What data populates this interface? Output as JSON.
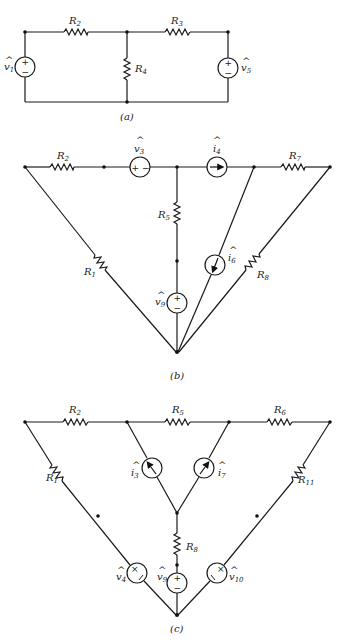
{
  "figure": {
    "panels": [
      {
        "id": "a",
        "caption": "(a)",
        "components": [
          {
            "type": "voltage-source",
            "label": "v1",
            "hat": true,
            "polarity": "+ top"
          },
          {
            "type": "resistor",
            "label": "R2"
          },
          {
            "type": "resistor",
            "label": "R3"
          },
          {
            "type": "resistor",
            "label": "R4"
          },
          {
            "type": "voltage-source",
            "label": "v5",
            "hat": true,
            "polarity": "+ top"
          }
        ]
      },
      {
        "id": "b",
        "caption": "(b)",
        "components": [
          {
            "type": "resistor",
            "label": "R1"
          },
          {
            "type": "resistor",
            "label": "R2"
          },
          {
            "type": "voltage-source",
            "label": "v3",
            "hat": true,
            "polarity": "+ left"
          },
          {
            "type": "current-source",
            "label": "i4",
            "hat": true,
            "direction": "right"
          },
          {
            "type": "resistor",
            "label": "R5"
          },
          {
            "type": "current-source",
            "label": "i6",
            "hat": true,
            "direction": "down"
          },
          {
            "type": "resistor",
            "label": "R7"
          },
          {
            "type": "resistor",
            "label": "R8"
          },
          {
            "type": "voltage-source",
            "label": "v9",
            "hat": true,
            "polarity": "+ top"
          }
        ]
      },
      {
        "id": "c",
        "caption": "(c)",
        "components": [
          {
            "type": "resistor",
            "label": "R1"
          },
          {
            "type": "resistor",
            "label": "R2"
          },
          {
            "type": "current-source",
            "label": "i3",
            "hat": true,
            "direction": "up-left"
          },
          {
            "type": "voltage-source",
            "label": "v4",
            "hat": true
          },
          {
            "type": "resistor",
            "label": "R5"
          },
          {
            "type": "resistor",
            "label": "R6"
          },
          {
            "type": "current-source",
            "label": "i7",
            "hat": true,
            "direction": "up-right"
          },
          {
            "type": "resistor",
            "label": "R8"
          },
          {
            "type": "voltage-source",
            "label": "v9",
            "hat": true,
            "polarity": "+ top"
          },
          {
            "type": "voltage-source",
            "label": "v10",
            "hat": true
          },
          {
            "type": "resistor",
            "label": "R11"
          }
        ]
      }
    ]
  },
  "labels": {
    "a": {
      "caption": "(a)",
      "R2": "R",
      "R2_sub": "2",
      "R3": "R",
      "R3_sub": "3",
      "R4": "R",
      "R4_sub": "4",
      "v1": "v",
      "v1_sub": "1",
      "v5": "v",
      "v5_sub": "5",
      "hat": "^",
      "plus": "+",
      "minus": "−"
    },
    "b": {
      "caption": "(b)",
      "R1": "R",
      "R1_sub": "1",
      "R2": "R",
      "R2_sub": "2",
      "R5": "R",
      "R5_sub": "5",
      "R7": "R",
      "R7_sub": "7",
      "R8": "R",
      "R8_sub": "8",
      "v3": "v",
      "v3_sub": "3",
      "i4": "i",
      "i4_sub": "4",
      "i6": "i",
      "i6_sub": "6",
      "v9": "v",
      "v9_sub": "9",
      "hat": "^",
      "plus": "+",
      "minus": "−"
    },
    "c": {
      "caption": "(c)",
      "R1": "R",
      "R1_sub": "1",
      "R2": "R",
      "R2_sub": "2",
      "R5": "R",
      "R5_sub": "5",
      "R6": "R",
      "R6_sub": "6",
      "R8": "R",
      "R8_sub": "8",
      "R11": "R",
      "R11_sub": "11",
      "i3": "i",
      "i3_sub": "3",
      "i7": "i",
      "i7_sub": "7",
      "v4": "v",
      "v4_sub": "4",
      "v9": "v",
      "v9_sub": "9",
      "v10": "v",
      "v10_sub": "10",
      "hat": "^",
      "plus": "+",
      "minus": "−",
      "cross": "×"
    }
  }
}
